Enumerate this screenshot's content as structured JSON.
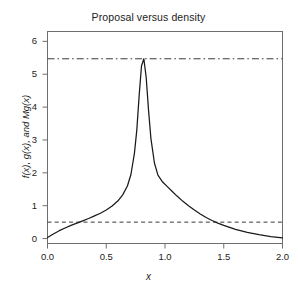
{
  "chart_data": {
    "type": "line",
    "title": "Proposal versus density",
    "xlabel": "x",
    "ylabel": "f(x), g(x), and Mg(x)",
    "xlim": [
      0,
      2
    ],
    "ylim": [
      -0.15,
      6.3
    ],
    "grid": false,
    "legend": "none",
    "xticks": [
      "0.0",
      "0.5",
      "1.0",
      "1.5",
      "2.0"
    ],
    "xtick_values": [
      0.0,
      0.5,
      1.0,
      1.5,
      2.0
    ],
    "yticks": [
      "0",
      "1",
      "2",
      "3",
      "4",
      "5",
      "6"
    ],
    "ytick_values": [
      0,
      1,
      2,
      3,
      4,
      5,
      6
    ],
    "series": [
      {
        "name": "f(x)",
        "style": "solid",
        "color": "#1a1a1a",
        "x": [
          0.0,
          0.05,
          0.1,
          0.15,
          0.2,
          0.25,
          0.3,
          0.35,
          0.4,
          0.45,
          0.5,
          0.55,
          0.6,
          0.64,
          0.68,
          0.71,
          0.74,
          0.76,
          0.78,
          0.8,
          0.82,
          0.84,
          0.86,
          0.88,
          0.91,
          0.94,
          0.98,
          1.02,
          1.06,
          1.1,
          1.15,
          1.2,
          1.25,
          1.3,
          1.35,
          1.4,
          1.45,
          1.5,
          1.6,
          1.7,
          1.8,
          1.9,
          2.0
        ],
        "y": [
          0.03,
          0.14,
          0.24,
          0.32,
          0.4,
          0.47,
          0.54,
          0.61,
          0.69,
          0.77,
          0.87,
          0.99,
          1.15,
          1.33,
          1.6,
          1.95,
          2.6,
          3.3,
          4.35,
          5.25,
          5.47,
          4.9,
          3.9,
          3.05,
          2.3,
          1.93,
          1.72,
          1.58,
          1.44,
          1.3,
          1.14,
          1.0,
          0.87,
          0.75,
          0.64,
          0.55,
          0.47,
          0.4,
          0.28,
          0.19,
          0.12,
          0.06,
          0.02
        ]
      },
      {
        "name": "Mg(x)",
        "style": "dashdot",
        "color": "#3a3a3a",
        "constant_y": 5.47
      },
      {
        "name": "g(x)",
        "style": "dashed",
        "color": "#3a3a3a",
        "constant_y": 0.5
      }
    ]
  },
  "plot": {
    "title": "Proposal versus density",
    "xlabel": "x",
    "ylabel": "f(x), g(x), and Mg(x)",
    "xticks": [
      {
        "label": "0.0"
      },
      {
        "label": "0.5"
      },
      {
        "label": "1.0"
      },
      {
        "label": "1.5"
      },
      {
        "label": "2.0"
      }
    ],
    "yticks": [
      {
        "label": "0"
      },
      {
        "label": "1"
      },
      {
        "label": "2"
      },
      {
        "label": "3"
      },
      {
        "label": "4"
      },
      {
        "label": "5"
      },
      {
        "label": "6"
      }
    ]
  },
  "colors": {
    "background": "#ffffff",
    "axis": "#6e6e6e",
    "curve": "#1a1a1a",
    "reference_line": "#3a3a3a",
    "text": "#1c1c1c"
  }
}
